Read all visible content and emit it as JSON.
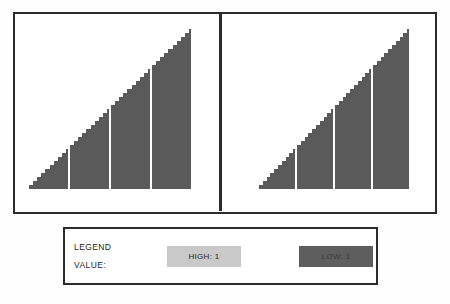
{
  "chart_data": [
    {
      "panel_id": "left",
      "type": "bar",
      "title": "",
      "xlabel": "",
      "ylabel": "",
      "orientation": "vertical",
      "bar_color": "#5a5a5a",
      "background": "#ffffff",
      "grid": false,
      "axis_ticks_visible": false,
      "tick_labels_visible": false,
      "xlim": [
        0,
        40
      ],
      "ylim": [
        0,
        1
      ],
      "categories": [
        "1",
        "2",
        "3",
        "4",
        "5",
        "6",
        "7",
        "8",
        "9",
        "10",
        "11",
        "12",
        "13",
        "14",
        "15",
        "16",
        "17",
        "18",
        "19",
        "20",
        "21",
        "22",
        "23",
        "24",
        "25",
        "26",
        "27",
        "28",
        "29",
        "30",
        "31",
        "32",
        "33",
        "34",
        "35",
        "36",
        "37",
        "38",
        "39",
        "40"
      ],
      "values": [
        0.025,
        0.05,
        0.075,
        0.1,
        0.125,
        0.15,
        0.175,
        0.2,
        0.225,
        0.25,
        0.275,
        0.3,
        0.325,
        0.35,
        0.375,
        0.4,
        0.425,
        0.45,
        0.475,
        0.5,
        0.525,
        0.55,
        0.575,
        0.6,
        0.625,
        0.65,
        0.675,
        0.7,
        0.725,
        0.75,
        0.775,
        0.8,
        0.825,
        0.85,
        0.875,
        0.9,
        0.925,
        0.95,
        0.975,
        1.0
      ],
      "group_separator_positions": [
        10,
        20,
        30,
        40
      ],
      "shape_description": "monotonically increasing ramp forming a right triangle with apex at top-right"
    },
    {
      "panel_id": "right",
      "type": "bar",
      "title": "",
      "xlabel": "",
      "ylabel": "",
      "orientation": "vertical",
      "bar_color": "#5a5a5a",
      "background": "#ffffff",
      "grid": false,
      "axis_ticks_visible": false,
      "tick_labels_visible": false,
      "xlim": [
        0,
        40
      ],
      "ylim": [
        0,
        1
      ],
      "categories": [
        "1",
        "2",
        "3",
        "4",
        "5",
        "6",
        "7",
        "8",
        "9",
        "10",
        "11",
        "12",
        "13",
        "14",
        "15",
        "16",
        "17",
        "18",
        "19",
        "20",
        "21",
        "22",
        "23",
        "24",
        "25",
        "26",
        "27",
        "28",
        "29",
        "30",
        "31",
        "32",
        "33",
        "34",
        "35",
        "36",
        "37",
        "38",
        "39",
        "40"
      ],
      "values": [
        0.025,
        0.05,
        0.075,
        0.1,
        0.125,
        0.15,
        0.175,
        0.2,
        0.225,
        0.25,
        0.275,
        0.3,
        0.325,
        0.35,
        0.375,
        0.4,
        0.425,
        0.45,
        0.475,
        0.5,
        0.525,
        0.55,
        0.575,
        0.6,
        0.625,
        0.65,
        0.675,
        0.7,
        0.725,
        0.75,
        0.775,
        0.8,
        0.825,
        0.85,
        0.875,
        0.9,
        0.925,
        0.95,
        0.975,
        1.0
      ],
      "group_separator_positions": [
        10,
        20,
        30,
        40
      ],
      "shape_description": "monotonically increasing ramp forming a right triangle with apex at top-right"
    }
  ],
  "legend": {
    "title_line_1": "LEGEND",
    "title_line_2": "VALUE:",
    "items": [
      {
        "label": "HIGH: 1",
        "color": "#c9c9c9"
      },
      {
        "label": "LOW: 1",
        "color": "#5e5e5e"
      }
    ]
  },
  "colors": {
    "border": "#2b2b2b",
    "bar_fill": "#5a5a5a",
    "legend_high": "#c9c9c9",
    "legend_low": "#5e5e5e",
    "background": "#ffffff"
  }
}
